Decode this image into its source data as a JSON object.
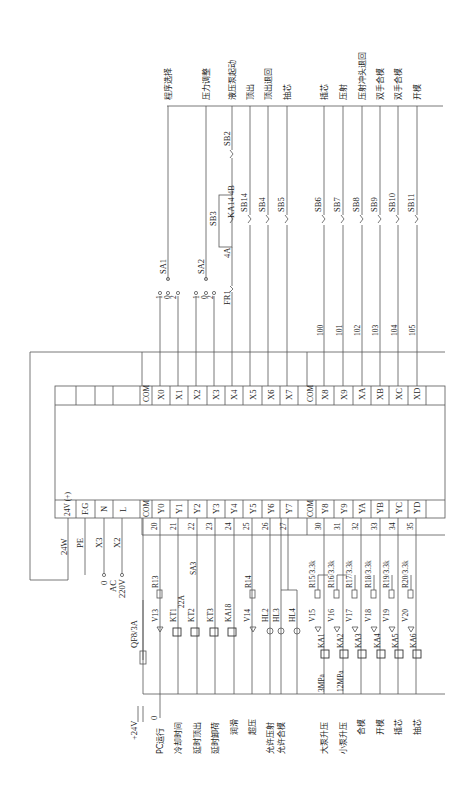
{
  "diagram": {
    "orientation": "rotated 90 degrees counter-clockwise",
    "plc": {
      "input_terminals": [
        "",
        "",
        "",
        "",
        "COM",
        "X0",
        "X1",
        "X2",
        "X3",
        "X4",
        "X5",
        "X6",
        "X7",
        "COM",
        "X8",
        "X9",
        "XA",
        "XB",
        "XC",
        "XD",
        ""
      ],
      "output_terminals": [
        "24V (+)",
        "F.G",
        "N",
        "L",
        "COM",
        "Y0",
        "Y1",
        "Y2",
        "Y3",
        "Y4",
        "Y5",
        "Y6",
        "Y7",
        "COM",
        "Y8",
        "Y9",
        "YA",
        "YB",
        "YC",
        "YD",
        ""
      ]
    },
    "inputs": {
      "functions": [
        "程序选择",
        "压力调整",
        "液压泵起动",
        "顶出",
        "顶出退回",
        "抽芯",
        "插芯",
        "压射",
        "压射冲头退回",
        "双手合模",
        "双手合模",
        "开模"
      ],
      "switches": {
        "sa1": "SA1",
        "sa2": "SA2",
        "sb2": "SB2",
        "sb3": "SB3",
        "ka14": "KA14",
        "sb14": "SB14",
        "sb4": "SB4",
        "sb5": "SB5",
        "sb6": "SB6",
        "sb7": "SB7",
        "sb8": "SB8",
        "sb9": "SB9",
        "sb10": "SB10",
        "sb11": "SB11",
        "fr1": "FR1"
      },
      "node_4a": "4A",
      "node_4b": "4B",
      "selector_positions": [
        "1",
        "0",
        "2"
      ],
      "wire_numbers": [
        "100",
        "101",
        "102",
        "103",
        "104",
        "105"
      ]
    },
    "power": {
      "supply_24w": "24W",
      "pe": "PE",
      "x3": "X3",
      "x2": "X2",
      "ac_0": "0",
      "ac_label": "AC",
      "ac_220": "220V",
      "breaker": "QF8/3A",
      "plus24v": "+24V",
      "zero": "0"
    },
    "outputs": {
      "wire_numbers": [
        "20",
        "21",
        "22",
        "23",
        "24",
        "25",
        "26",
        "27",
        "30",
        "31",
        "32",
        "33",
        "34",
        "35"
      ],
      "components": {
        "v13": "V13",
        "r13": "R13",
        "kt1": "KT1",
        "kt2": "KT2",
        "kt3": "KT3",
        "sa3": "SA3",
        "rating_22a": "22A",
        "ka18": "KA18",
        "v14": "V14",
        "r14": "R14",
        "hl2": "HL2",
        "hl3": "HL3",
        "hl4": "HL4",
        "v15": "V15",
        "r15": "R15/3.3k",
        "ka1": "KA1",
        "v16": "V16",
        "r16": "R16/3.3k",
        "ka2": "KA2",
        "v17": "V17",
        "r17": "R17/3.3k",
        "ka3": "KA3",
        "v18": "V18",
        "r18": "R18/3.3k",
        "ka4": "KA4",
        "v19": "V19",
        "r19": "R19/3.3k",
        "ka5": "KA5",
        "v20": "V20",
        "r20": "R20/3.3k",
        "ka6": "KA6",
        "p3": "3MPa",
        "p12": "12MPa"
      },
      "functions": [
        "PC运行",
        "冷却时间",
        "延时顶出",
        "延时卸荷",
        "润滑",
        "超压",
        "允许压射",
        "允许合模",
        "大泵升压",
        "小泵升压",
        "合模",
        "开模",
        "插芯",
        "抽芯"
      ]
    }
  }
}
